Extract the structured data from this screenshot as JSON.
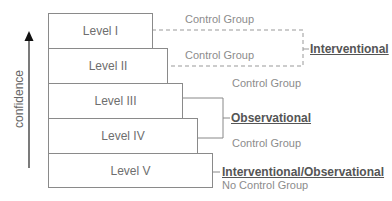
{
  "diagram": {
    "axis": {
      "label": "confidence",
      "direction": "up"
    },
    "levels": [
      {
        "label": "Level I",
        "group": "Control Group"
      },
      {
        "label": "Level II",
        "group": "Control Group"
      },
      {
        "label": "Level III",
        "group": "Control Group"
      },
      {
        "label": "Level IV",
        "group": "Control Group"
      },
      {
        "label": "Level V",
        "group": "No Control Group"
      }
    ],
    "categories": [
      {
        "label": "Interventional",
        "levels": [
          "Level I",
          "Level II"
        ],
        "line_style": "dashed"
      },
      {
        "label": "Observational",
        "levels": [
          "Level III",
          "Level IV"
        ],
        "line_style": "solid"
      },
      {
        "label": "Interventional/Observational",
        "levels": [
          "Level V"
        ],
        "line_style": "solid"
      }
    ],
    "colors": {
      "box_border": "#8a8a8a",
      "text": "#6e6e6e",
      "category_text": "#555555",
      "group_text": "#8c8c8c"
    }
  }
}
